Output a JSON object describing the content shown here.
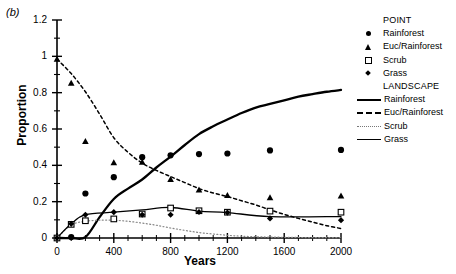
{
  "panel": {
    "label": "(b)"
  },
  "axes": {
    "ylabel": "Proportion",
    "xlabel": "Years",
    "yticks": [
      "0",
      "0.2",
      "0.4",
      "0.6",
      "0.8",
      "1",
      "1.2"
    ],
    "xticks": [
      "0",
      "400",
      "800",
      "1200",
      "1600",
      "2000"
    ]
  },
  "legend": {
    "point_header": "POINT",
    "landscape_header": "LANDSCAPE",
    "point_items": [
      {
        "label": "Rainforest",
        "marker": "circle-filled-icon"
      },
      {
        "label": "Euc/Rainforest",
        "marker": "triangle-filled-icon"
      },
      {
        "label": "Scrub",
        "marker": "square-open-icon"
      },
      {
        "label": "Grass",
        "marker": "diamond-filled-icon"
      }
    ],
    "landscape_items": [
      {
        "label": "Rainforest",
        "line": "solid-thick-line-icon"
      },
      {
        "label": "Euc/Rainforest",
        "line": "dashed-line-icon"
      },
      {
        "label": "Scrub",
        "line": "dotted-line-icon"
      },
      {
        "label": "Grass",
        "line": "solid-thin-line-icon"
      }
    ]
  },
  "chart_data": {
    "type": "scatter",
    "title": "",
    "xlabel": "Years",
    "ylabel": "Proportion",
    "xlim": [
      0,
      2000
    ],
    "ylim": [
      0,
      1.2
    ],
    "grid": false,
    "legend_position": "right",
    "x": [
      0,
      100,
      200,
      400,
      600,
      800,
      1000,
      1200,
      1500,
      2000
    ],
    "point_series": [
      {
        "name": "Rainforest",
        "marker": "circle-filled",
        "values": [
          0.0,
          0.005,
          0.245,
          0.335,
          0.445,
          0.455,
          0.462,
          0.465,
          0.482,
          0.485
        ]
      },
      {
        "name": "Euc/Rainforest",
        "marker": "triangle-filled",
        "values": [
          0.985,
          0.852,
          0.532,
          0.415,
          0.418,
          0.322,
          0.265,
          0.235,
          0.222,
          0.232
        ]
      },
      {
        "name": "Scrub",
        "marker": "square-open",
        "values": [
          0.0,
          0.075,
          0.095,
          0.105,
          0.132,
          0.165,
          0.15,
          0.142,
          0.148,
          0.142
        ]
      },
      {
        "name": "Grass",
        "marker": "diamond-filled",
        "values": [
          0.0,
          0.078,
          0.128,
          0.142,
          0.128,
          0.128,
          0.143,
          0.14,
          0.108,
          0.098
        ]
      }
    ],
    "landscape_series": [
      {
        "name": "Rainforest",
        "line": "solid-thick",
        "x": [
          0,
          100,
          200,
          300,
          400,
          500,
          600,
          700,
          800,
          900,
          1000,
          1100,
          1200,
          1300,
          1400,
          1500,
          1600,
          1700,
          1800,
          1900,
          2000
        ],
        "values": [
          0.0,
          0.0,
          0.005,
          0.115,
          0.215,
          0.272,
          0.322,
          0.388,
          0.448,
          0.512,
          0.572,
          0.615,
          0.652,
          0.688,
          0.718,
          0.738,
          0.758,
          0.778,
          0.792,
          0.805,
          0.815
        ]
      },
      {
        "name": "Euc/Rainforest",
        "line": "dashed",
        "x": [
          0,
          100,
          200,
          300,
          400,
          500,
          600,
          700,
          800,
          900,
          1000,
          1100,
          1200,
          1300,
          1400,
          1500,
          1600,
          1700,
          1800,
          1900,
          2000
        ],
        "values": [
          0.985,
          0.905,
          0.805,
          0.682,
          0.552,
          0.472,
          0.412,
          0.372,
          0.338,
          0.305,
          0.272,
          0.248,
          0.228,
          0.205,
          0.182,
          0.155,
          0.13,
          0.108,
          0.088,
          0.068,
          0.052
        ]
      },
      {
        "name": "Scrub",
        "line": "dotted",
        "x": [
          0,
          100,
          200,
          300,
          400,
          500,
          600,
          700,
          800,
          900,
          1000,
          1100,
          1200,
          1300,
          1400,
          1500,
          1600,
          1700,
          1800,
          1900,
          2000
        ],
        "values": [
          0.0,
          0.072,
          0.092,
          0.098,
          0.098,
          0.092,
          0.082,
          0.07,
          0.055,
          0.042,
          0.03,
          0.022,
          0.015,
          0.01,
          0.007,
          0.005,
          0.004,
          0.003,
          0.002,
          0.002,
          0.002
        ]
      },
      {
        "name": "Grass",
        "line": "solid-thin",
        "x": [
          0,
          100,
          200,
          400,
          600,
          800,
          1000,
          1200,
          1500,
          2000
        ],
        "values": [
          0.0,
          0.078,
          0.128,
          0.142,
          0.155,
          0.168,
          0.148,
          0.14,
          0.118,
          0.118
        ]
      }
    ]
  }
}
